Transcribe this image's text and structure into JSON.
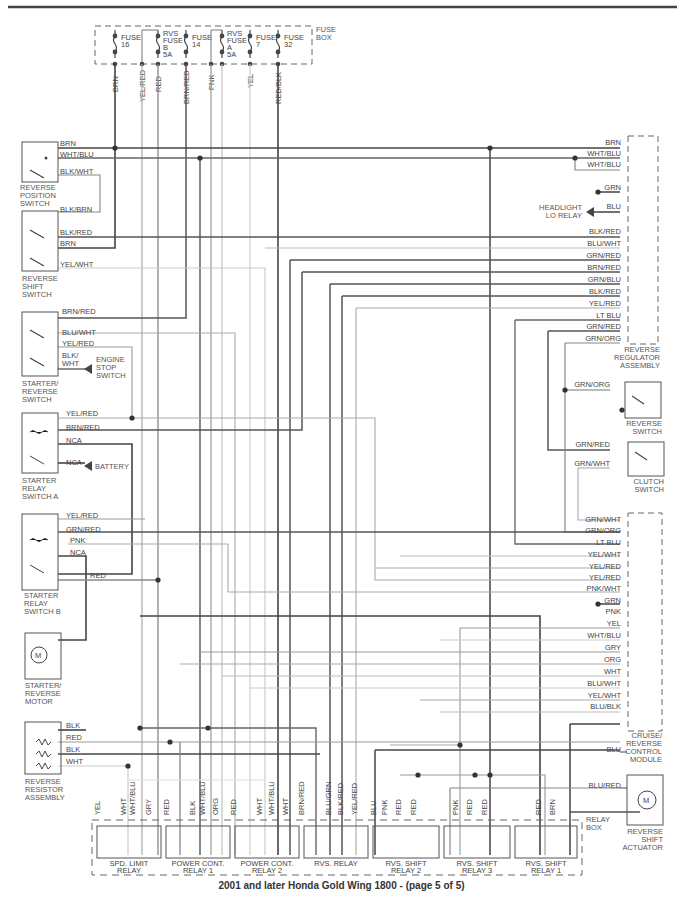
{
  "caption": "2001 and later Honda Gold Wing 1800 - (page 5 of 5)",
  "colors": {
    "dark": "#4a4a4a",
    "mid": "#7a7a7a",
    "light": "#b5b5b5",
    "vlight": "#d0d0d0"
  },
  "fuse_box": {
    "label": [
      "FUSE",
      "BOX"
    ],
    "fuses": [
      {
        "name": [
          "FUSE",
          "16"
        ],
        "x": 115
      },
      {
        "name": [
          "RVS",
          "FUSE",
          "B",
          "5A"
        ],
        "x": 158
      },
      {
        "name": [
          "FUSE",
          "14"
        ],
        "x": 186
      },
      {
        "name": [
          "RVS",
          "FUSE",
          "A",
          "5A"
        ],
        "x": 222
      },
      {
        "name": [
          "FUSE",
          "7"
        ],
        "x": 250
      },
      {
        "name": [
          "FUSE",
          "32"
        ],
        "x": 278
      }
    ],
    "wires": [
      {
        "label": "BRN",
        "x": 115
      },
      {
        "label": "YEL/RED",
        "x": 142
      },
      {
        "label": "RED",
        "x": 158
      },
      {
        "label": "BRN/RED",
        "x": 186
      },
      {
        "label": "PNK",
        "x": 211
      },
      {
        "label": "YEL",
        "x": 250
      },
      {
        "label": "RED/BLK",
        "x": 278
      }
    ]
  },
  "left_components": [
    {
      "name": [
        "REVERSE",
        "POSITION",
        "SWITCH"
      ],
      "pins": [
        "BRN",
        "WHT/BLU",
        "BLK/WHT"
      ]
    },
    {
      "name": [
        "REVERSE",
        "SHIFT",
        "SWITCH"
      ],
      "pins": [
        "BLK/BRN",
        "BLK/RED",
        "BRN",
        "YEL/WHT"
      ]
    },
    {
      "name": [
        "STARTER/",
        "REVERSE",
        "SWITCH"
      ],
      "pins": [
        "BRN/RED",
        "BLU/WHT",
        "YEL/RED",
        "BLK/",
        "WHT"
      ],
      "extra": [
        "ENGINE",
        "STOP",
        "SWITCH"
      ]
    },
    {
      "name": [
        "STARTER",
        "RELAY",
        "SWITCH A"
      ],
      "pins": [
        "YEL/RED",
        "BRN/RED",
        "NCA",
        "NCA"
      ],
      "extra": [
        "BATTERY"
      ]
    },
    {
      "name": [
        "STARTER",
        "RELAY",
        "SWITCH B"
      ],
      "pins": [
        "YEL/RED",
        "GRN/RED",
        "PNK",
        "NCA",
        "RED"
      ]
    },
    {
      "name": [
        "STARTER/",
        "REVERSE",
        "MOTOR"
      ],
      "pins": [],
      "symbol": "M"
    },
    {
      "name": [
        "REVERSE",
        "RESISTOR",
        "ASSEMBLY"
      ],
      "pins": [
        "BLK",
        "RED",
        "BLK",
        "WHT"
      ]
    }
  ],
  "right_components": {
    "top_pins": [
      "BRN",
      "WHT/BLU",
      "WHT/BLU"
    ],
    "grn_ground": "GRN",
    "headlight": {
      "pin": "BLU",
      "label": [
        "HEADLIGHT",
        "LO RELAY"
      ]
    },
    "regulator_pins": [
      "BLK/RED",
      "BLU/WHT",
      "GRN/RED",
      "BRN/RED",
      "GRN/BLU",
      "BLK/RED",
      "YEL/RED",
      "LT BLU",
      "GRN/RED",
      "GRN/ORG"
    ],
    "regulator_name": [
      "REVERSE",
      "REGULATOR",
      "ASSEMBLY"
    ],
    "reverse_switch": {
      "pin": "GRN/ORG",
      "name": [
        "REVERSE",
        "SWITCH"
      ]
    },
    "clutch_switch": {
      "pins": [
        "GRN/RED",
        "GRN/WHT"
      ],
      "name": [
        "CLUTCH",
        "SWITCH"
      ]
    },
    "cruise_pins": [
      "GRN/WHT",
      "GRN/ORG",
      "LT BLU",
      "YEL/WHT",
      "YEL/RED",
      "YEL/RED",
      "PNK/WHT",
      "GRN",
      "PNK",
      "YEL",
      "WHT/BLU",
      "GRY",
      "ORG",
      "WHT",
      "BLU/WHT",
      "YEL/WHT",
      "BLU/BLK"
    ],
    "cruise_name": [
      "CRUISE/",
      "REVERSE",
      "CONTROL",
      "MODULE"
    ],
    "actuator": {
      "pins": [
        "BLU",
        "BLU/RED"
      ],
      "name": [
        "REVERSE",
        "SHIFT",
        "ACTUATOR"
      ],
      "symbol": "M"
    }
  },
  "relay_box": {
    "label": [
      "RELAY",
      "BOX"
    ],
    "relays": [
      {
        "name": [
          "SPD. LIMIT",
          "RELAY"
        ],
        "pins": [
          "YEL",
          "WHT",
          "WHT/BLU",
          "GRY"
        ]
      },
      {
        "name": [
          "POWER CONT.",
          "RELAY 1"
        ],
        "pins": [
          "RED",
          "BLK",
          "WHT/BLU",
          "ORG"
        ]
      },
      {
        "name": [
          "POWER CONT.",
          "RELAY 2"
        ],
        "pins": [
          "RED",
          "WHT",
          "WHT/BLU",
          "WHT"
        ]
      },
      {
        "name": [
          "RVS. RELAY"
        ],
        "pins": [
          "BRN/RED",
          "BLU/GRN",
          "BLK/RED",
          "YEL/RED"
        ]
      },
      {
        "name": [
          "RVS. SHIFT",
          "RELAY 2"
        ],
        "pins": [
          "BLU",
          "PNK",
          "RED",
          "RED"
        ]
      },
      {
        "name": [
          "RVS. SHIFT",
          "RELAY 3"
        ],
        "pins": [
          "PNK",
          "RED",
          "RED"
        ]
      },
      {
        "name": [
          "RVS. SHIFT",
          "RELAY 1"
        ],
        "pins": [
          "RED",
          "BRN"
        ]
      }
    ],
    "bottom_labels": [
      "YEL",
      "WHT",
      "WHT/BLU",
      "GRY",
      "RED",
      "BLK",
      "WHT/BLU",
      "ORG",
      "RED",
      "WHT",
      "WHT/BLU",
      "WHT",
      "BRN/RED",
      "BLU/GRN",
      "BLK/RED",
      "YEL/RED",
      "BLU",
      "PNK",
      "RED",
      "RED",
      "PNK",
      "RED",
      "RED",
      "RED",
      "BRN"
    ]
  }
}
